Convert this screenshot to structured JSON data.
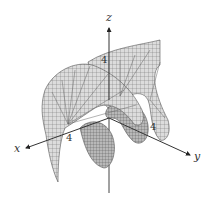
{
  "figure": {
    "background": "#ffffff",
    "surface_fill": "#d8d8d8",
    "surface_shade": "#a9a9a9",
    "mesh_color": "#555555",
    "axis_color": "#333333"
  },
  "axes": {
    "x": {
      "label": "x",
      "tick": "4"
    },
    "y": {
      "label": "y",
      "tick": "4"
    },
    "z": {
      "label": "z",
      "tick": "4"
    }
  }
}
